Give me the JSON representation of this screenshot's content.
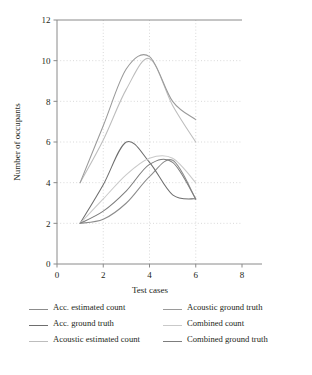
{
  "chart_data": {
    "type": "line",
    "title": "",
    "xlabel": "Test cases",
    "ylabel": "Number of occupants",
    "xlim": [
      0,
      8
    ],
    "ylim": [
      0,
      12
    ],
    "xticks": [
      0,
      2,
      4,
      6,
      8
    ],
    "yticks": [
      0,
      2,
      4,
      6,
      8,
      10,
      12
    ],
    "grid": true,
    "legend_position": "bottom",
    "x": [
      1,
      2,
      3,
      4,
      5,
      6
    ],
    "series": [
      {
        "name": "Acc. estimated count",
        "color": "#8c8c8c",
        "values": [
          2.0,
          2.2,
          3.0,
          4.3,
          5.1,
          3.2
        ]
      },
      {
        "name": "Acc. ground truth",
        "color": "#6e6e6e",
        "values": [
          2.0,
          3.9,
          6.0,
          5.0,
          3.4,
          3.2
        ]
      },
      {
        "name": "Acoustic estimated count",
        "color": "#bdbdbd",
        "values": [
          4.0,
          6.1,
          8.6,
          10.1,
          7.8,
          6.0
        ]
      },
      {
        "name": "Acoustic ground truth",
        "color": "#9a9a9a",
        "values": [
          4.0,
          6.8,
          9.6,
          10.2,
          8.0,
          7.1
        ]
      },
      {
        "name": "Combined count",
        "color": "#c9c9c9",
        "values": [
          2.0,
          3.2,
          4.4,
          5.2,
          5.2,
          4.0
        ]
      },
      {
        "name": "Combined ground truth",
        "color": "#7d7d7d",
        "values": [
          2.0,
          2.6,
          3.6,
          4.9,
          5.0,
          3.2
        ]
      }
    ]
  },
  "axes": {
    "ylabel": "Number of occupants",
    "xlabel": "Test cases",
    "xticklabels": [
      "0",
      "2",
      "4",
      "6",
      "8"
    ],
    "yticklabels": [
      "0",
      "2",
      "4",
      "6",
      "8",
      "10",
      "12"
    ]
  },
  "legend": {
    "columns": [
      [
        {
          "label": "Acc. estimated count",
          "color": "#8c8c8c"
        },
        {
          "label": "Acc. ground truth",
          "color": "#6e6e6e"
        },
        {
          "label": "Acoustic estimated count",
          "color": "#bdbdbd"
        }
      ],
      [
        {
          "label": "Acoustic ground truth",
          "color": "#9a9a9a"
        },
        {
          "label": "Combined count",
          "color": "#c9c9c9"
        },
        {
          "label": "Combined ground truth",
          "color": "#7d7d7d"
        }
      ]
    ]
  },
  "style": {
    "axis_color": "#8a8a8a",
    "grid_color": "#c8c8c8",
    "text_color": "#231f20",
    "background": "#ffffff"
  }
}
